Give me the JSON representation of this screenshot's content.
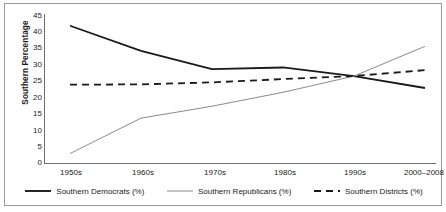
{
  "chart_data": {
    "type": "line",
    "title": "",
    "xlabel": "",
    "ylabel": "Southern Percentage",
    "ylim": [
      0,
      45
    ],
    "yticks": [
      0,
      5,
      10,
      15,
      20,
      25,
      30,
      35,
      40,
      45
    ],
    "grid": false,
    "legend_position": "bottom",
    "categories": [
      "1950s",
      "1960s",
      "1970s",
      "1980s",
      "1990s",
      "2000–2008"
    ],
    "series": [
      {
        "name": "Southern Democrats (%)",
        "style": "solid",
        "color": "#1a1a1a",
        "width": 1.8,
        "values": [
          41.6,
          34.0,
          28.5,
          29.0,
          26.4,
          22.8
        ]
      },
      {
        "name": "Southern Republicans (%)",
        "style": "solid",
        "color": "#8a8a8a",
        "width": 1.0,
        "values": [
          3.0,
          13.7,
          17.3,
          21.5,
          26.4,
          35.4
        ]
      },
      {
        "name": "Southern Districts (%)",
        "style": "dashed",
        "color": "#1a1a1a",
        "width": 1.8,
        "values": [
          23.8,
          23.9,
          24.5,
          25.5,
          26.4,
          28.2
        ]
      }
    ]
  },
  "axis": {
    "y_title": "Southern Percentage",
    "y_tick_labels": [
      "45",
      "40",
      "35",
      "30",
      "25",
      "20",
      "15",
      "10",
      "5",
      "0"
    ],
    "x_tick_labels": [
      "1950s",
      "1960s",
      "1970s",
      "1980s",
      "1990s",
      "2000–2008"
    ]
  },
  "legend": {
    "items": [
      {
        "label": "Southern Democrats (%)",
        "swatch": "solid-thick-black-line-icon"
      },
      {
        "label": "Southern Republicans (%)",
        "swatch": "solid-thin-gray-line-icon"
      },
      {
        "label": "Southern Districts (%)",
        "swatch": "dashed-black-line-icon"
      }
    ]
  },
  "colors": {
    "democrats": "#1a1a1a",
    "republicans": "#8a8a8a",
    "districts": "#1a1a1a",
    "axis": "#6e6e6e",
    "frame": "#9a9a9a"
  }
}
